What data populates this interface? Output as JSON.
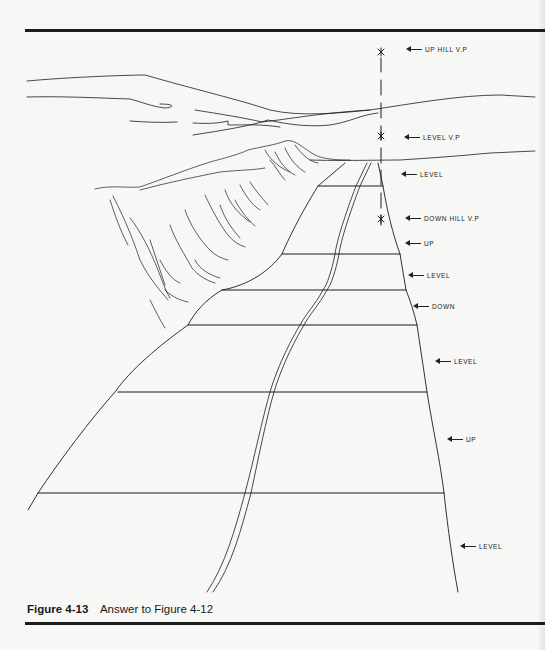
{
  "figure": {
    "number": "Figure 4-13",
    "caption": "Answer to Figure 4-12"
  },
  "annotations": [
    {
      "id": "up-hill-vp",
      "text": "UP HILL V.P",
      "x": 408,
      "y": 49
    },
    {
      "id": "level-vp",
      "text": "LEVEL V.P",
      "x": 406,
      "y": 137
    },
    {
      "id": "level-1",
      "text": "LEVEL",
      "x": 403,
      "y": 174
    },
    {
      "id": "down-hill-vp",
      "text": "DOWN HILL V.P",
      "x": 407,
      "y": 218
    },
    {
      "id": "up-1",
      "text": "UP",
      "x": 407,
      "y": 243
    },
    {
      "id": "level-2",
      "text": "LEVEL",
      "x": 410,
      "y": 275
    },
    {
      "id": "down",
      "text": "DOWN",
      "x": 415,
      "y": 306
    },
    {
      "id": "level-3",
      "text": "LEVEL",
      "x": 437,
      "y": 361
    },
    {
      "id": "up-2",
      "text": "UP",
      "x": 449,
      "y": 439
    },
    {
      "id": "level-4",
      "text": "LEVEL",
      "x": 462,
      "y": 546
    }
  ],
  "colors": {
    "ink": "#1c1c1c",
    "paper": "#f7f7f5"
  }
}
